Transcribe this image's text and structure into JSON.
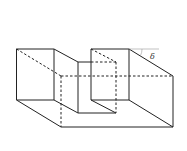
{
  "figure": {
    "angle_label": "δ",
    "colors": {
      "line": "#222222",
      "reference_line": "#999999",
      "background": "#ffffff"
    }
  }
}
